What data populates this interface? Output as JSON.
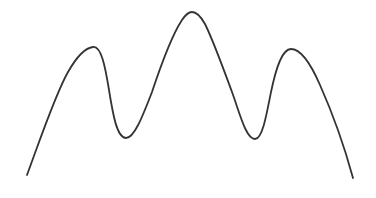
{
  "figure": {
    "stroke_color": "#333333",
    "background_color": "#ffffff",
    "stroke_width": 1.8
  },
  "curve": {
    "points": [
      {
        "label": "start",
        "x": 27,
        "y": 175
      },
      {
        "label": "left-peak",
        "x": 93,
        "y": 47
      },
      {
        "label": "left-valley",
        "x": 126,
        "y": 138
      },
      {
        "label": "center-peak",
        "x": 192,
        "y": 12
      },
      {
        "label": "right-valley",
        "x": 255,
        "y": 139
      },
      {
        "label": "right-peak",
        "x": 291,
        "y": 49
      },
      {
        "label": "end",
        "x": 353,
        "y": 178
      }
    ]
  }
}
